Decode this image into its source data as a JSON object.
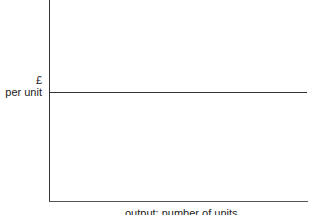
{
  "diagram": {
    "y_axis_label": {
      "line1": "£",
      "line2": "per unit"
    },
    "x_axis_label": "output: number of units",
    "lines": [
      {
        "name": "horizontal-level-line",
        "description": "constant price/cost per unit"
      }
    ]
  }
}
